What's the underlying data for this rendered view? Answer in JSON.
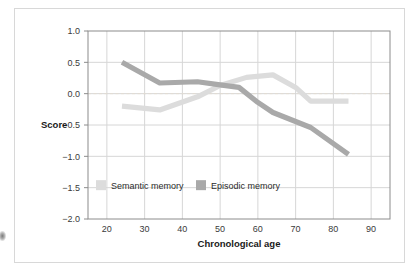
{
  "chart_data": {
    "type": "line",
    "title": "",
    "xlabel": "Chronological age",
    "ylabel": "Score",
    "xlim": [
      15,
      95
    ],
    "ylim": [
      -2.0,
      1.0
    ],
    "grid": true,
    "zero_reference_line": true,
    "legend_position": "inside-bottom-left",
    "xticks": [
      20,
      30,
      40,
      50,
      60,
      70,
      80,
      90
    ],
    "xtick_labels": [
      "20",
      "30",
      "40",
      "50",
      "60",
      "70",
      "80",
      "90"
    ],
    "yticks": [
      1.0,
      0.5,
      0.0,
      -0.5,
      -1.0,
      -1.5,
      -2.0
    ],
    "ytick_labels": [
      "1.0",
      "0.5",
      "0.0",
      "−0.5",
      "−1.0",
      "−1.5",
      "−2.0"
    ],
    "series": [
      {
        "name": "Semantic memory",
        "color": "#dcdcdc",
        "x": [
          24,
          34,
          44,
          50,
          57,
          64,
          70,
          74,
          84
        ],
        "values": [
          -0.2,
          -0.26,
          -0.05,
          0.13,
          0.26,
          0.3,
          0.1,
          -0.12,
          -0.12
        ]
      },
      {
        "name": "Episodic memory",
        "color": "#a9a9a9",
        "x": [
          24,
          34,
          44,
          50,
          55,
          60,
          64,
          74,
          84
        ],
        "values": [
          0.5,
          0.17,
          0.19,
          0.14,
          0.1,
          -0.14,
          -0.3,
          -0.54,
          -0.97
        ]
      }
    ]
  },
  "axes": {
    "y_axis_label": "Score",
    "x_axis_label": "Chronological age"
  },
  "legend": {
    "items": [
      {
        "label": "Semantic memory",
        "color": "#dcdcdc"
      },
      {
        "label": "Episodic memory",
        "color": "#a9a9a9"
      }
    ]
  },
  "colors": {
    "semantic": "#dcdcdc",
    "episodic": "#a9a9a9",
    "grid": "#d6d6d6",
    "frame": "#8c8c8c",
    "card_border": "#d8d8d8",
    "zero_line": "#e2dcd2",
    "text": "#3a3a3a"
  }
}
